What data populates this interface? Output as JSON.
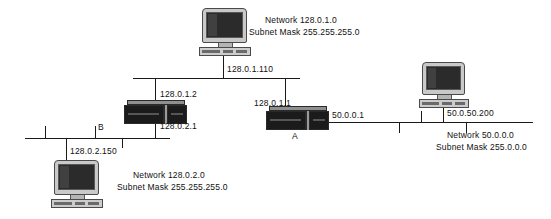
{
  "diagram": {
    "line_color": "#1a1a1a",
    "background": "#ffffff"
  },
  "networks": [
    {
      "id": "net-128-0-1-0",
      "network_line": "Network 128.0.1.0",
      "mask_line": "Subnet Mask 255.255.255.0"
    },
    {
      "id": "net-128-0-2-0",
      "network_line": "Network 128.0.2.0",
      "mask_line": "Subnet Mask 255.255.255.0"
    },
    {
      "id": "net-50-0-0-0",
      "network_line": "Network 50.0.0.0",
      "mask_line": "Subnet Mask 255.0.0.0"
    }
  ],
  "hosts": [
    {
      "id": "host-top",
      "ip": "128.0.1.110",
      "icon": "desktop-computer-icon"
    },
    {
      "id": "host-bottom-left",
      "ip": "128.0.2.150",
      "icon": "desktop-computer-icon"
    },
    {
      "id": "host-right",
      "ip": "50.0.50.200",
      "icon": "desktop-computer-icon"
    }
  ],
  "routers": [
    {
      "id": "router-b",
      "name": "B",
      "icon": "router-icon",
      "interfaces": [
        {
          "ip": "128.0.1.2"
        },
        {
          "ip": "128.0.2.1"
        }
      ]
    },
    {
      "id": "router-a",
      "name": "A",
      "icon": "router-icon",
      "interfaces": [
        {
          "ip": "128.0.1.1"
        },
        {
          "ip": "50.0.0.1"
        }
      ]
    }
  ]
}
